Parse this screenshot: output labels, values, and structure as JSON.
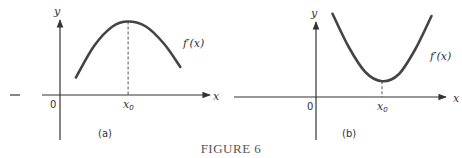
{
  "caption": "FIGURE 6",
  "chart_data": [
    {
      "type": "line",
      "panel_label": "(a)",
      "title": "",
      "xlabel": "x",
      "ylabel": "y",
      "origin_label": "0",
      "curve_label": "f′(x)",
      "critical_point_label": "x",
      "critical_point_subscript": "0",
      "shape": "concave-down (maximum at x0)",
      "xlim": [
        -1.2,
        6.5
      ],
      "ylim": [
        -2.5,
        4.6
      ],
      "series": [
        {
          "name": "f'(x)",
          "x": [
            0.7,
            1.5,
            2.3,
            3.0,
            3.8,
            4.6,
            5.3
          ],
          "y": [
            1.0,
            2.8,
            3.9,
            4.2,
            3.9,
            2.9,
            1.6
          ]
        }
      ],
      "x0": 3.0
    },
    {
      "type": "line",
      "panel_label": "(b)",
      "title": "",
      "xlabel": "x",
      "ylabel": "y",
      "origin_label": "0",
      "curve_label": "f′(x)",
      "critical_point_label": "x",
      "critical_point_subscript": "0",
      "shape": "concave-up (minimum at x0)",
      "xlim": [
        -3.2,
        5.2
      ],
      "ylim": [
        -2.5,
        4.6
      ],
      "series": [
        {
          "name": "f'(x)",
          "x": [
            0.6,
            1.2,
            1.8,
            2.4,
            3.0,
            3.6,
            4.2
          ],
          "y": [
            3.7,
            2.2,
            1.1,
            0.7,
            1.0,
            2.1,
            3.6
          ]
        }
      ],
      "x0": 2.4
    }
  ]
}
